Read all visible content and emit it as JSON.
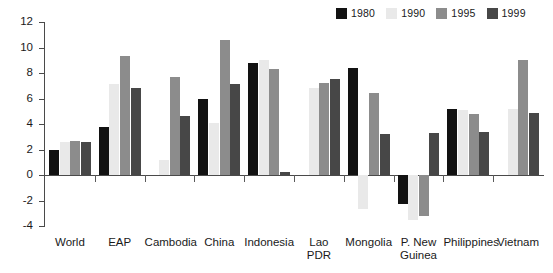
{
  "chart_data": {
    "type": "bar",
    "title": "",
    "xlabel": "",
    "ylabel": "",
    "ylim": [
      -4,
      12
    ],
    "yticks": [
      12,
      10,
      8,
      6,
      4,
      2,
      0,
      -2,
      -4
    ],
    "ytick_labels": [
      "12",
      "10",
      "8",
      "6",
      "4",
      "2",
      "0",
      "-2",
      "-4"
    ],
    "grid": false,
    "legend_position": "top-right",
    "categories": [
      "World",
      "EAP",
      "Cambodia",
      "China",
      "Indonesia",
      "Lao\nPDR",
      "Mongolia",
      "P. New\nGuinea",
      "Philippines",
      "Vietnam"
    ],
    "series": [
      {
        "name": "1980",
        "color": "#121212",
        "values": [
          2.0,
          3.8,
          null,
          6.0,
          8.8,
          null,
          8.4,
          -2.3,
          5.2,
          null
        ]
      },
      {
        "name": "1990",
        "color": "#e9e9e9",
        "values": [
          2.6,
          7.1,
          1.2,
          4.1,
          9.0,
          6.8,
          -2.7,
          -3.5,
          5.1,
          5.2
        ]
      },
      {
        "name": "1995",
        "color": "#8c8c8c",
        "values": [
          2.7,
          9.3,
          7.7,
          10.6,
          8.3,
          7.2,
          6.4,
          -3.2,
          4.8,
          9.0
        ]
      },
      {
        "name": "1999",
        "color": "#474747",
        "values": [
          2.6,
          6.8,
          4.6,
          7.1,
          0.2,
          7.5,
          3.2,
          3.3,
          3.4,
          4.9
        ]
      }
    ]
  },
  "legend": {
    "items": [
      {
        "label": "1980",
        "color": "#121212"
      },
      {
        "label": "1990",
        "color": "#e9e9e9"
      },
      {
        "label": "1995",
        "color": "#8c8c8c"
      },
      {
        "label": "1999",
        "color": "#474747"
      }
    ]
  }
}
